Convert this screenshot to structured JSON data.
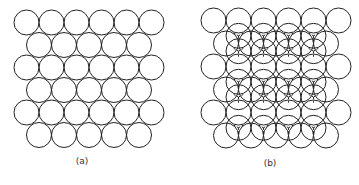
{
  "figure": {
    "panels": [
      {
        "id": "a",
        "label": "(a)",
        "description": "Single close-packed layer of spheres",
        "origin_x": 14,
        "origin_y": 10,
        "radius": 12.5,
        "row_spacing": 22.5,
        "rows": [
          6,
          5,
          6,
          5,
          6,
          5
        ],
        "upper_layer": null,
        "label_x": 82,
        "label_y": 156
      },
      {
        "id": "b",
        "label": "(b)",
        "description": "Second layer placed in hollows of the first, with tripod contact lines",
        "origin_x": 201,
        "origin_y": 8,
        "radius": 12.5,
        "row_spacing": 23,
        "rows": [
          6,
          5,
          6,
          5,
          6,
          5
        ],
        "upper_layer": {
          "rows": [
            4,
            5,
            4,
            5,
            4
          ],
          "tripod_style": "dashed"
        },
        "label_x": 270,
        "label_y": 158
      }
    ],
    "colors": {
      "stroke": "#222222",
      "background": "#ffffff",
      "label": "#333333"
    }
  }
}
